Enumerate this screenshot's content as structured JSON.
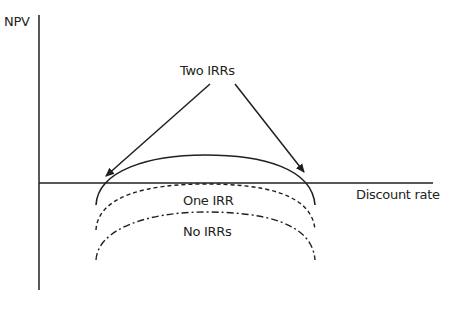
{
  "diagram": {
    "y_axis_label": "NPV",
    "x_axis_label": "Discount rate",
    "annotation_top": "Two IRRs",
    "curves": [
      {
        "name": "two-irrs-curve",
        "style": "solid",
        "label": "Two IRRs",
        "crosses_axis": 2
      },
      {
        "name": "one-irr-curve",
        "style": "dashed",
        "label": "One IRR",
        "crosses_axis": 1
      },
      {
        "name": "no-irrs-curve",
        "style": "dash-dot",
        "label": "No IRRs",
        "crosses_axis": 0
      }
    ],
    "labels": {
      "one_irr": "One IRR",
      "no_irrs": "No IRRs"
    },
    "colors": {
      "line": "#231f20",
      "background": "#ffffff"
    }
  }
}
